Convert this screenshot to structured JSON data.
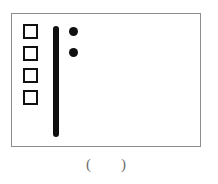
{
  "figure": {
    "panel": {
      "border_color": "#8c8c8c",
      "background_color": "#ffffff"
    },
    "squares": {
      "count": 4,
      "fill": "#ffffff",
      "stroke": "#101010",
      "items": [
        {
          "index": 1
        },
        {
          "index": 2
        },
        {
          "index": 3
        },
        {
          "index": 4
        }
      ]
    },
    "bar": {
      "color": "#101010",
      "orientation": "vertical"
    },
    "dots": {
      "count": 2,
      "color": "#101010",
      "items": [
        {
          "index": 1
        },
        {
          "index": 2
        }
      ]
    },
    "caption": {
      "paren_open": "(",
      "blank": "",
      "paren_close": ")",
      "text_color": "#6e6e6e"
    }
  }
}
